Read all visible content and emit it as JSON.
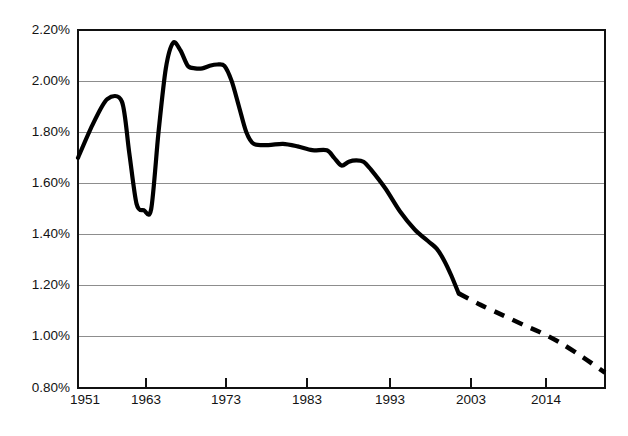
{
  "chart_data": {
    "type": "line",
    "title": "",
    "subtitle": "",
    "xlabel": "",
    "ylabel": "",
    "xlim": [
      1951,
      2023
    ],
    "ylim": [
      0.8,
      2.2
    ],
    "grid": true,
    "legend": false,
    "y_tick_labels": [
      "2.20%",
      "2.00%",
      "1.80%",
      "1.60%",
      "1.40%",
      "1.20%",
      "1.00%",
      "0.80%"
    ],
    "y_tick_values": [
      2.2,
      2.0,
      1.8,
      1.6,
      1.4,
      1.2,
      1.0,
      0.8
    ],
    "x_tick_labels": [
      "1951",
      "1963",
      "1973",
      "1983",
      "1993",
      "2003",
      "2014"
    ],
    "x_tick_values": [
      1951,
      1963,
      1973,
      1983,
      1993,
      2003,
      2014
    ],
    "y_unit": "percent",
    "series": [
      {
        "name": "historical",
        "style": "solid",
        "x": [
          1951,
          1953,
          1955,
          1957,
          1958,
          1959,
          1960,
          1961,
          1962,
          1963,
          1964,
          1965,
          1966,
          1967,
          1968,
          1969,
          1970,
          1971,
          1972,
          1973,
          1974,
          1975,
          1977,
          1979,
          1981,
          1983,
          1985,
          1986,
          1987,
          1988,
          1989,
          1990,
          1991,
          1993,
          1995,
          1997,
          1999,
          2000,
          2001,
          2002,
          2003
        ],
        "y": [
          1.7,
          1.83,
          1.93,
          1.92,
          1.72,
          1.52,
          1.495,
          1.5,
          1.8,
          2.05,
          2.15,
          2.12,
          2.06,
          2.05,
          2.05,
          2.06,
          2.065,
          2.06,
          2.0,
          1.9,
          1.8,
          1.755,
          1.75,
          1.755,
          1.745,
          1.73,
          1.73,
          1.7,
          1.67,
          1.685,
          1.69,
          1.685,
          1.655,
          1.58,
          1.49,
          1.42,
          1.37,
          1.345,
          1.3,
          1.24,
          1.17
        ]
      },
      {
        "name": "projection",
        "style": "dashed",
        "x": [
          2003,
          2006,
          2009,
          2012,
          2014,
          2017,
          2020,
          2023
        ],
        "y": [
          1.17,
          1.125,
          1.085,
          1.045,
          1.02,
          0.975,
          0.92,
          0.86
        ]
      }
    ],
    "annotations": [
      {
        "text": "solid line = historical values",
        "visible": false
      },
      {
        "text": "dashed line = projected values",
        "visible": false
      }
    ]
  },
  "colors": {
    "series": "#000000",
    "grid": "#8d8d8d",
    "frame": "#111111",
    "background": "#ffffff",
    "text": "#131313"
  },
  "axes": {
    "y_labels": [
      {
        "text": "2.20%"
      },
      {
        "text": "2.00%"
      },
      {
        "text": "1.80%"
      },
      {
        "text": "1.60%"
      },
      {
        "text": "1.40%"
      },
      {
        "text": "1.20%"
      },
      {
        "text": "1.00%"
      },
      {
        "text": "0.80%"
      }
    ],
    "x_labels": [
      {
        "text": "1951"
      },
      {
        "text": "1963"
      },
      {
        "text": "1973"
      },
      {
        "text": "1983"
      },
      {
        "text": "1993"
      },
      {
        "text": "2003"
      },
      {
        "text": "2014"
      }
    ]
  }
}
